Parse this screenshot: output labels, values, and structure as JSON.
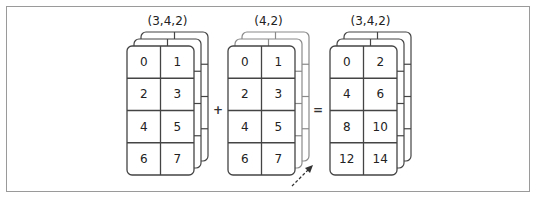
{
  "diagram": {
    "operators": {
      "plus": "+",
      "equals": "="
    },
    "stroke_color": "#444444",
    "broadcast_stroke_color": "#8a8a8a",
    "operands": [
      {
        "name": "array-a",
        "shape_label": "(3,4,2)",
        "x": 127,
        "y": 46,
        "layers": 3,
        "broadcast_copies": false,
        "front_values": [
          [
            0,
            1
          ],
          [
            2,
            3
          ],
          [
            4,
            5
          ],
          [
            6,
            7
          ]
        ]
      },
      {
        "name": "array-b",
        "shape_label": "(4,2)",
        "x": 228,
        "y": 46,
        "layers": 3,
        "broadcast_copies": true,
        "front_values": [
          [
            0,
            1
          ],
          [
            2,
            3
          ],
          [
            4,
            5
          ],
          [
            6,
            7
          ]
        ]
      },
      {
        "name": "result",
        "shape_label": "(3,4,2)",
        "x": 330,
        "y": 46,
        "layers": 3,
        "broadcast_copies": false,
        "front_values": [
          [
            0,
            2
          ],
          [
            4,
            6
          ],
          [
            8,
            10
          ],
          [
            12,
            14
          ]
        ]
      }
    ],
    "broadcast_arrow": {
      "style": "dashed",
      "direction": "up-right"
    }
  }
}
